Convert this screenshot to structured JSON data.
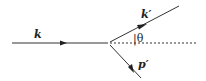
{
  "diagram": {
    "labels": {
      "incoming": "k",
      "outgoing": "k′",
      "angle": "|θ",
      "recoil": "p′"
    },
    "colors": {
      "line": "#333333",
      "background": "#ffffff"
    }
  }
}
